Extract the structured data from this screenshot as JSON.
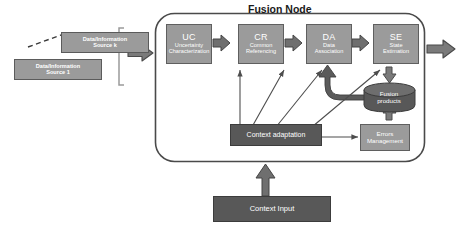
{
  "diagram": {
    "title": "Fusion Node",
    "sources": [
      {
        "line1": "Data/Information",
        "line2": "Source k"
      },
      {
        "line1": "Data/Information",
        "line2": "Source 1"
      }
    ],
    "processes": [
      {
        "code": "UC",
        "desc_line1": "Uncertainty",
        "desc_line2": "Characterization"
      },
      {
        "code": "CR",
        "desc_line1": "Common",
        "desc_line2": "Referencing"
      },
      {
        "code": "DA",
        "desc_line1": "Data",
        "desc_line2": "Association"
      },
      {
        "code": "SE",
        "desc_line1": "State",
        "desc_line2": "Estimation"
      }
    ],
    "store": {
      "line1": "Fusion",
      "line2": "products"
    },
    "errors": {
      "line1": "Errors",
      "line2": "Management"
    },
    "context_adaptation": "Context adaptation",
    "context_input": "Context Input",
    "colors": {
      "process_fill": "#9b9b9b",
      "process_stroke": "#5f5f5f",
      "dark_fill": "#585858",
      "dark_stroke": "#3c3c3c",
      "arrow_thick": "#7a7a7a",
      "arrow_thick_stroke": "#4a4a4a",
      "line": "#4d4d4d",
      "node_border": "#4a4a4a",
      "background": "#ffffff",
      "title_text": "#1a1a1a"
    }
  }
}
